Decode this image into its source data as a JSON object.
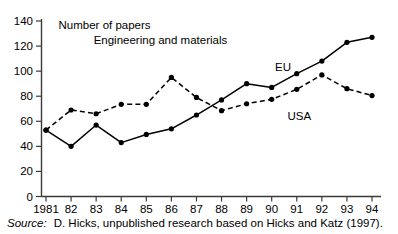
{
  "chart_data": {
    "type": "line",
    "title": "",
    "annotations": [
      {
        "text": "Number of papers",
        "x": 0.5,
        "y": 137
      },
      {
        "text": "Engineering and materials",
        "x": 1.9,
        "y": 125
      }
    ],
    "xlabel": "",
    "ylabel": "",
    "categories": [
      "1981",
      "82",
      "83",
      "84",
      "85",
      "86",
      "87",
      "88",
      "89",
      "90",
      "91",
      "92",
      "93",
      "94"
    ],
    "x_tick_labels": [
      "1981",
      "82",
      "83",
      "84",
      "85",
      "86",
      "87",
      "88",
      "89",
      "90",
      "91",
      "92",
      "93",
      "94"
    ],
    "y_tick_labels": [
      "0",
      "20",
      "40",
      "60",
      "80",
      "100",
      "120",
      "140"
    ],
    "y_ticks": [
      0,
      20,
      40,
      60,
      80,
      100,
      120,
      140
    ],
    "ylim": [
      0,
      140
    ],
    "xlim": [
      0,
      13
    ],
    "grid": false,
    "legend_position": "inline-annotation",
    "series": [
      {
        "name": "EU",
        "style": "solid",
        "color": "#000000",
        "marker": "filled-circle",
        "label_x": 9.45,
        "label_y": 103,
        "values": [
          53,
          40,
          57,
          43,
          49.5,
          54,
          65,
          77,
          90,
          87,
          98,
          108,
          123,
          127
        ]
      },
      {
        "name": "USA",
        "style": "dashed",
        "color": "#000000",
        "marker": "filled-circle",
        "label_x": 10.1,
        "label_y": 64,
        "values": [
          53,
          69,
          66,
          73.5,
          73.5,
          95,
          79,
          68.5,
          74,
          77.5,
          85.5,
          97,
          86,
          80.5
        ]
      }
    ]
  },
  "source": {
    "label": "Source:",
    "text": "D. Hicks, unpublished research based on Hicks and Katz (1997)."
  }
}
